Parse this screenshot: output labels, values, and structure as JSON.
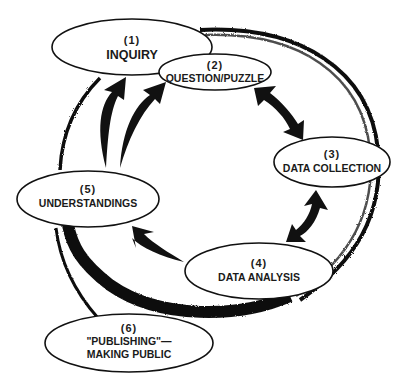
{
  "diagram": {
    "type": "cycle",
    "colors": {
      "stroke": "#111111",
      "fill": "#ffffff",
      "text": "#1a1a1a"
    },
    "nodes": [
      {
        "id": "inquiry",
        "number": "(1)",
        "label": "INQUIRY"
      },
      {
        "id": "question",
        "number": "(2)",
        "label": "QUESTION/PUZZLE"
      },
      {
        "id": "data-collection",
        "number": "(3)",
        "label": "DATA COLLECTION"
      },
      {
        "id": "data-analysis",
        "number": "(4)",
        "label": "DATA ANALYSIS"
      },
      {
        "id": "understandings",
        "number": "(5)",
        "label": "UNDERSTANDINGS"
      },
      {
        "id": "publishing",
        "number": "(6)",
        "label_line1": "\"PUBLISHING\"—",
        "label_line2": "MAKING PUBLIC"
      }
    ],
    "arrows": [
      {
        "from": "question",
        "to": "data-collection",
        "style": "double-headed"
      },
      {
        "from": "data-collection",
        "to": "data-analysis",
        "style": "double-headed"
      },
      {
        "from": "data-analysis",
        "to": "understandings",
        "style": "single"
      },
      {
        "from": "understandings",
        "to": "inquiry",
        "style": "single"
      },
      {
        "from": "understandings",
        "to": "question",
        "style": "single"
      }
    ]
  }
}
